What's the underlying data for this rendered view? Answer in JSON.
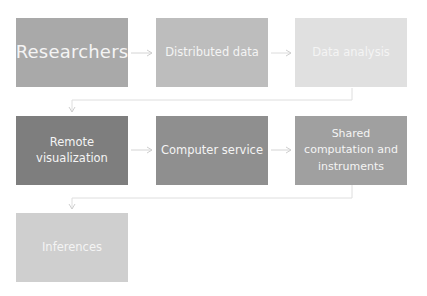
{
  "diagram": {
    "type": "flowchart",
    "nodes": [
      {
        "id": "researchers",
        "label": "Researchers",
        "row": 1,
        "col": 1,
        "color": "#a9a9a9"
      },
      {
        "id": "distributed_data",
        "label": "Distributed data",
        "row": 1,
        "col": 2,
        "color": "#bdbdbd"
      },
      {
        "id": "data_analysis",
        "label": "Data analysis",
        "row": 1,
        "col": 3,
        "color": "#e0e0e0"
      },
      {
        "id": "remote_visualization",
        "label": "Remote visualization",
        "row": 2,
        "col": 1,
        "color": "#7e7e7e"
      },
      {
        "id": "computer_service",
        "label": "Computer service",
        "row": 2,
        "col": 2,
        "color": "#8f8f8f"
      },
      {
        "id": "shared_computation",
        "label": "Shared computation and instruments",
        "row": 2,
        "col": 3,
        "color": "#a0a0a0"
      },
      {
        "id": "inferences",
        "label": "Inferences",
        "row": 3,
        "col": 1,
        "color": "#cfcfcf"
      }
    ],
    "edges": [
      {
        "from": "researchers",
        "to": "distributed_data"
      },
      {
        "from": "distributed_data",
        "to": "data_analysis"
      },
      {
        "from": "data_analysis",
        "to": "remote_visualization"
      },
      {
        "from": "remote_visualization",
        "to": "computer_service"
      },
      {
        "from": "computer_service",
        "to": "shared_computation"
      },
      {
        "from": "shared_computation",
        "to": "inferences"
      }
    ],
    "connector_color": "#d6d6d6",
    "text_color": "#f4f4f4"
  },
  "labels": {
    "researchers": "Researchers",
    "distributed_data": "Distributed data",
    "data_analysis": "Data analysis",
    "remote_visualization_l1": "Remote",
    "remote_visualization_l2": "visualization",
    "computer_service": "Computer service",
    "shared_l1": "Shared",
    "shared_l2": "computation and",
    "shared_l3": "instruments",
    "inferences": "Inferences"
  }
}
